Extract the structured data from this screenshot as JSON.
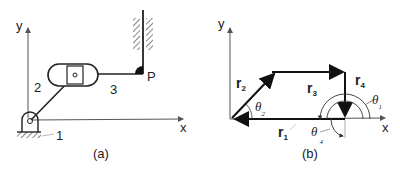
{
  "panel_a": {
    "caption": "(a)",
    "axis_x_label": "x",
    "axis_y_label": "y",
    "link_labels": {
      "ground": "1",
      "crank": "2",
      "coupler": "3"
    },
    "point_label": "P"
  },
  "panel_b": {
    "caption": "(b)",
    "axis_x_label": "x",
    "axis_y_label": "y",
    "vectors": [
      {
        "name": "r",
        "sub": "1"
      },
      {
        "name": "r",
        "sub": "2"
      },
      {
        "name": "r",
        "sub": "3"
      },
      {
        "name": "r",
        "sub": "4"
      }
    ],
    "angles": [
      {
        "name": "θ",
        "sub": "1"
      },
      {
        "name": "θ",
        "sub": "2"
      },
      {
        "name": "θ",
        "sub": "4"
      }
    ]
  },
  "colors": {
    "line": "#222222",
    "axis": "#555555",
    "background": "#ffffff"
  }
}
